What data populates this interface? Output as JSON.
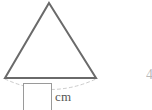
{
  "figure": {
    "name": "isosceles-triangle-with-arc",
    "stroke_color": "#6a6a6a",
    "arc_color": "#cccccc",
    "fill_color": "#ffffff",
    "apex": {
      "x": 49,
      "y": 3
    },
    "base_left": {
      "x": 5,
      "y": 78
    },
    "base_right": {
      "x": 96,
      "y": 78
    },
    "arc": {
      "start": {
        "x": 5,
        "y": 79
      },
      "end": {
        "x": 96,
        "y": 79
      },
      "control": {
        "x": 50,
        "y": 100
      },
      "dashed": true
    }
  },
  "answer": {
    "value": "",
    "placeholder": ""
  },
  "units": {
    "label": "cm"
  },
  "edge": {
    "clipped_glyph": "4"
  }
}
